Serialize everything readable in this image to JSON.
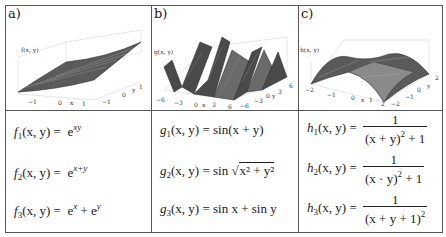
{
  "panels": [
    {
      "label": "a)",
      "zlabel": "f(x, y)",
      "x_ticks": [
        "−1",
        "0",
        "x",
        "1"
      ],
      "y_ticks": [
        "−1",
        "0",
        "y",
        "1"
      ],
      "formulas": [
        {
          "lhs": "f",
          "sub": "1",
          "args": "(x, y) =",
          "rhs": "e",
          "sup": "xy"
        },
        {
          "lhs": "f",
          "sub": "2",
          "args": "(x, y) =",
          "rhs": "e",
          "sup": "x+y"
        },
        {
          "lhs": "f",
          "sub": "3",
          "args": "(x, y) =",
          "rhs": "e",
          "sup": "x",
          "rhs2": " + e",
          "sup2": "y"
        }
      ]
    },
    {
      "label": "b)",
      "zlabel": "g(x, y)",
      "x_ticks": [
        "−6",
        "−3",
        "0",
        "x",
        "3",
        "6"
      ],
      "y_ticks": [
        "−6",
        "−3",
        "0",
        "y",
        "3",
        "6"
      ],
      "formulas": [
        {
          "lhs": "g",
          "sub": "1",
          "args": "(x, y) =",
          "rhs": "sin(x + y)"
        },
        {
          "lhs": "g",
          "sub": "2",
          "args": "(x, y) =",
          "rhs": "sin",
          "sqrt": "x² + y²"
        },
        {
          "lhs": "g",
          "sub": "3",
          "args": "(x, y) =",
          "rhs": "sin x + sin y"
        }
      ]
    },
    {
      "label": "c)",
      "zlabel": "h(x, y)",
      "x_ticks": [
        "−2",
        "−1",
        "0",
        "x",
        "1",
        "2"
      ],
      "y_ticks": [
        "−2",
        "−1",
        "0",
        "y",
        "2"
      ],
      "formulas": [
        {
          "lhs": "h",
          "sub": "1",
          "args": "(x, y) =",
          "num": "1",
          "den": "(x + y)",
          "den_sup": "2",
          "den_tail": " + 1"
        },
        {
          "lhs": "h",
          "sub": "2",
          "args": "(x, y) =",
          "num": "1",
          "den": "(x · y)",
          "den_sup": "2",
          "den_tail": " + 1"
        },
        {
          "lhs": "h",
          "sub": "3",
          "args": "(x, y) =",
          "num": "1",
          "den": "(x + y + 1)",
          "den_sup": "2",
          "den_tail": ""
        }
      ]
    }
  ]
}
